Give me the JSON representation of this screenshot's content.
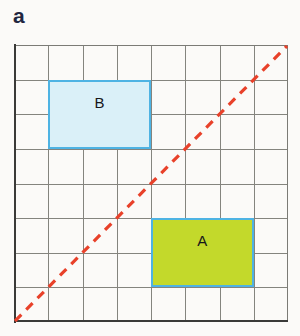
{
  "figure": {
    "panel_label": "a",
    "background_color": "#fbfaf8"
  },
  "grid": {
    "columns": 8,
    "rows": 8,
    "line_color": "#84847e",
    "axis_color": "#3a3a38"
  },
  "regions": [
    {
      "id": "region-b",
      "label": "B",
      "fill_color": "#daf0f8",
      "border_color": "#4eb3e3",
      "col_start": 1,
      "col_span": 3,
      "row_start": 1,
      "row_span": 2
    },
    {
      "id": "region-a",
      "label": "A",
      "fill_color": "#c3d92b",
      "border_color": "#4eb3e3",
      "col_start": 4,
      "col_span": 3,
      "row_start": 5,
      "row_span": 2
    }
  ],
  "diagonal": {
    "name": "diagonal-dashed-line",
    "color": "#e8412a",
    "style": "dashed",
    "from": "bottom-left",
    "to": "top-right"
  }
}
